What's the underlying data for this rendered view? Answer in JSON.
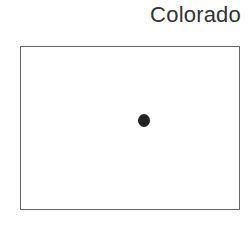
{
  "title": "Colorado",
  "shape": {
    "type": "rectangle",
    "border_color": "#666666",
    "fill_color": "#ffffff"
  },
  "marker": {
    "type": "capital-dot",
    "color": "#222222"
  }
}
